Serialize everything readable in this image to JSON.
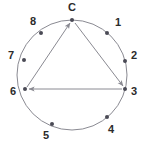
{
  "figure": {
    "type": "directed-cycle-on-circle",
    "width": 142,
    "height": 151,
    "background": "#ffffff",
    "circle": {
      "cx": 72,
      "cy": 75,
      "r": 55,
      "stroke": "#8a8a92",
      "stroke_width": 1
    },
    "style": {
      "node_dot_color": "#4a4a55",
      "node_dot_radius": 2,
      "edge_color": "#8a8a92",
      "edge_width": 1,
      "label_color": "#2b2b2b",
      "label_size": 11
    },
    "nodes": [
      {
        "id": "C",
        "label": "C",
        "angle_deg": 90,
        "cx": 72,
        "cy": 20,
        "lx": 72,
        "ly": 8,
        "anchor": "middle"
      },
      {
        "id": "1",
        "label": "1",
        "angle_deg": 50,
        "cx": 107,
        "cy": 33,
        "lx": 118,
        "ly": 23,
        "anchor": "middle"
      },
      {
        "id": "2",
        "label": "2",
        "angle_deg": 15,
        "cx": 125,
        "cy": 61,
        "lx": 134,
        "ly": 56,
        "anchor": "middle"
      },
      {
        "id": "3",
        "label": "3",
        "angle_deg": -15,
        "cx": 125,
        "cy": 89,
        "lx": 134,
        "ly": 92,
        "anchor": "middle"
      },
      {
        "id": "4",
        "label": "4",
        "angle_deg": -50,
        "cx": 107,
        "cy": 117,
        "lx": 111,
        "ly": 130,
        "anchor": "middle"
      },
      {
        "id": "5",
        "label": "5",
        "angle_deg": -130,
        "cx": 52,
        "cy": 124,
        "lx": 46,
        "ly": 136,
        "anchor": "middle"
      },
      {
        "id": "6",
        "label": "6",
        "angle_deg": 180,
        "cx": 25,
        "cy": 89,
        "lx": 13,
        "ly": 92,
        "anchor": "middle"
      },
      {
        "id": "7",
        "label": "7",
        "angle_deg": 160,
        "cx": 24,
        "cy": 60,
        "lx": 11,
        "ly": 56,
        "anchor": "middle"
      },
      {
        "id": "8",
        "label": "8",
        "angle_deg": 125,
        "cx": 41,
        "cy": 33,
        "lx": 33,
        "ly": 22,
        "anchor": "middle"
      }
    ],
    "edges": [
      {
        "id": "edge-6-to-C",
        "from": "6",
        "to": "C",
        "directed": true,
        "x1": 27,
        "y1": 87,
        "x2": 70,
        "y2": 23
      },
      {
        "id": "edge-C-to-3",
        "from": "C",
        "to": "3",
        "directed": true,
        "x1": 75,
        "y1": 23,
        "x2": 123,
        "y2": 86
      },
      {
        "id": "edge-3-to-6",
        "from": "3",
        "to": "6",
        "directed": true,
        "x1": 122,
        "y1": 89,
        "x2": 29,
        "y2": 89
      }
    ]
  }
}
